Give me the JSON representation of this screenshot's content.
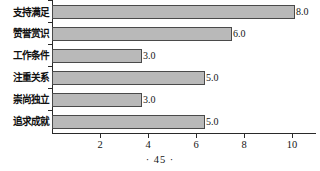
{
  "chart_data": {
    "type": "bar",
    "orientation": "horizontal",
    "title": "",
    "xlabel": "",
    "ylabel": "",
    "categories": [
      "支持满足",
      "赞誉赏识",
      "工作条件",
      "注重关系",
      "崇尚独立",
      "追求成就"
    ],
    "values": [
      8.0,
      6.0,
      3.0,
      5.0,
      3.0,
      5.0
    ],
    "value_labels": [
      "8.0",
      "6.0",
      "3.0",
      "5.0",
      "3.0",
      "5.0"
    ],
    "bar_pixel_lengths": [
      243,
      180,
      90,
      153,
      90,
      153
    ],
    "xticks": [
      2,
      4,
      6,
      8,
      10
    ],
    "xtick_labels": [
      "2",
      "4",
      "6",
      "8",
      "10"
    ],
    "xlim": [
      0,
      11
    ],
    "grid": false,
    "legend": null,
    "bar_color": "#b9b9b9",
    "bar_edge_color": "#4a4a4a",
    "axis_color": "#2a2a2a"
  },
  "footer": {
    "page_number": "· 45 ·"
  }
}
